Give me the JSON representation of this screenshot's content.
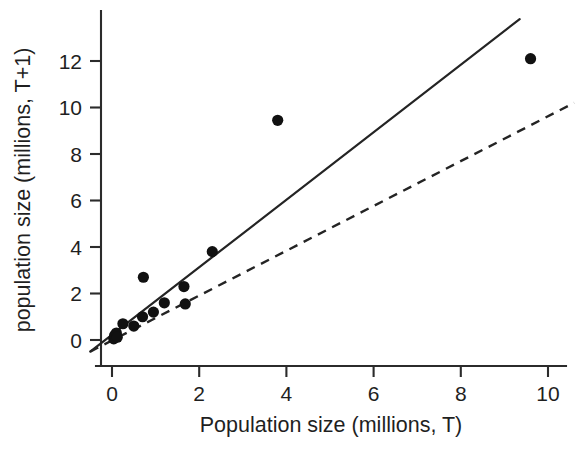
{
  "figure": {
    "kind": "scientific-scatter-plot",
    "background_color": "#ffffff",
    "ink_color": "#1f1f1f"
  },
  "chart_data": {
    "type": "scatter",
    "title": "",
    "xlabel": "Population size (millions, T)",
    "ylabel": "population size (millions, T+1)",
    "xlim": [
      -0.55,
      10.6
    ],
    "ylim": [
      -0.6,
      13.2
    ],
    "xticks": [
      0,
      2,
      4,
      6,
      8,
      10
    ],
    "xticklabels": [
      "0",
      "2",
      "4",
      "6",
      "8",
      "10"
    ],
    "yticks": [
      0,
      2,
      4,
      6,
      8,
      10,
      12
    ],
    "yticklabels": [
      "0",
      "2",
      "4",
      "6",
      "8",
      "10",
      "12"
    ],
    "grid": false,
    "legend": false,
    "legend_position": "none",
    "marker": "filled-circle",
    "marker_color": "#111111",
    "points": [
      {
        "x": 0.04,
        "y": 0.05
      },
      {
        "x": 0.06,
        "y": 0.2
      },
      {
        "x": 0.1,
        "y": 0.3
      },
      {
        "x": 0.12,
        "y": 0.12
      },
      {
        "x": 0.25,
        "y": 0.7
      },
      {
        "x": 0.5,
        "y": 0.6
      },
      {
        "x": 0.7,
        "y": 1.0
      },
      {
        "x": 0.72,
        "y": 2.7
      },
      {
        "x": 0.95,
        "y": 1.2
      },
      {
        "x": 1.2,
        "y": 1.6
      },
      {
        "x": 1.65,
        "y": 2.3
      },
      {
        "x": 1.68,
        "y": 1.55
      },
      {
        "x": 2.3,
        "y": 3.8
      },
      {
        "x": 3.8,
        "y": 9.45
      },
      {
        "x": 9.6,
        "y": 12.1
      }
    ],
    "series": [
      {
        "name": "fitted-regression-line",
        "style": "solid",
        "color": "#242424",
        "x": [
          -0.5,
          9.35
        ],
        "y": [
          -0.5,
          13.8
        ]
      },
      {
        "name": "replacement-reference-line",
        "style": "dashed",
        "color": "#242424",
        "x": [
          -0.5,
          10.6
        ],
        "y": [
          -0.5,
          10.2
        ]
      }
    ],
    "axis_pixel_map": {
      "x0_px": 112,
      "x_px_per_unit": 43.6,
      "y0_px": 340,
      "y_px_per_unit": 23.25
    }
  }
}
